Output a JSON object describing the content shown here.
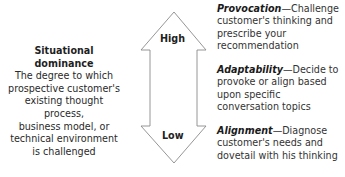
{
  "left": {
    "title": "Situational dominance",
    "description_lines": [
      "The degree to which",
      "prospective customer's",
      "existing thought process,",
      "business model, or",
      "technical environment",
      "is challenged"
    ]
  },
  "arrow": {
    "top_label": "High",
    "bottom_label": "Low",
    "stroke_color": "#8a8a8a"
  },
  "right": {
    "items": [
      {
        "name": "Provocation",
        "dash": "—",
        "text": "Challenge customer's thinking and prescribe your recommendation"
      },
      {
        "name": "Adaptability",
        "dash": "—",
        "text": "Decide to provoke or align based upon specific conversation topics"
      },
      {
        "name": "Alignment",
        "dash": "—",
        "text": "Diagnose customer's needs and dovetail with his thinking"
      }
    ]
  }
}
